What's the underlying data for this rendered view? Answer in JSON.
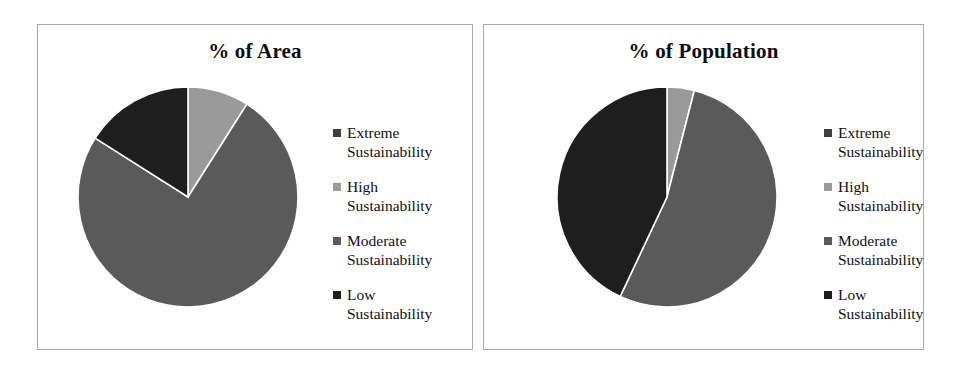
{
  "figure": {
    "background": "#ffffff",
    "panel_border_color": "#a9a9a9"
  },
  "series_colors": {
    "extreme": "#3f3f3f",
    "high": "#9a9a9a",
    "moderate": "#5a5a5a",
    "low": "#1e1e1e"
  },
  "legend": {
    "items": [
      {
        "key": "extreme",
        "label": "Extreme\nSustainability",
        "color": "#3f3f3f"
      },
      {
        "key": "high",
        "label": "High\nSustainability",
        "color": "#9a9a9a"
      },
      {
        "key": "moderate",
        "label": "Moderate\nSustainability",
        "color": "#5a5a5a"
      },
      {
        "key": "low",
        "label": "Low\nSustainability",
        "color": "#1e1e1e"
      }
    ]
  },
  "panels": [
    {
      "id": "area",
      "title": "% of Area"
    },
    {
      "id": "population",
      "title": "% of Population"
    }
  ],
  "chart_data": [
    {
      "type": "pie",
      "title": "% of Area",
      "categories": [
        "Extreme Sustainability",
        "High Sustainability",
        "Moderate Sustainability",
        "Low Sustainability"
      ],
      "values": [
        0,
        9,
        75,
        16
      ],
      "colors": [
        "#3f3f3f",
        "#9a9a9a",
        "#5a5a5a",
        "#1e1e1e"
      ],
      "unit": "%",
      "start_angle_deg": 0,
      "direction": "clockwise",
      "legend_position": "right",
      "slice_angles_deg": [
        0,
        32,
        269,
        59
      ]
    },
    {
      "type": "pie",
      "title": "% of Population",
      "categories": [
        "Extreme Sustainability",
        "High Sustainability",
        "Moderate Sustainability",
        "Low Sustainability"
      ],
      "values": [
        0,
        4,
        53,
        43
      ],
      "colors": [
        "#3f3f3f",
        "#9a9a9a",
        "#5a5a5a",
        "#1e1e1e"
      ],
      "unit": "%",
      "start_angle_deg": 0,
      "direction": "clockwise",
      "legend_position": "right",
      "slice_angles_deg": [
        0,
        15,
        191,
        154
      ]
    }
  ]
}
